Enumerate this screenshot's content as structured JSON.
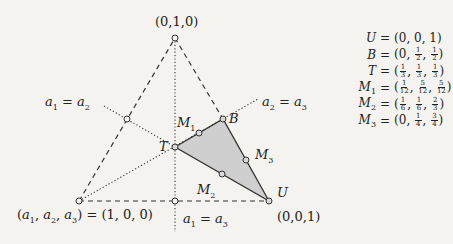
{
  "diagram": {
    "colors": {
      "background": "#f4f3ef",
      "line": "#333333",
      "shade": "#cfcfcf",
      "point_fill": "#d8d8d8"
    },
    "vertices": {
      "top": {
        "label": "(0,1,0)",
        "x": 175,
        "y": 38
      },
      "left": {
        "label": "(a1,a2,a3) = (1,0,0)",
        "x": 79,
        "y": 201
      },
      "right": {
        "label": "(0,0,1)",
        "x": 269,
        "y": 201
      }
    },
    "points": {
      "T": {
        "label": "T",
        "x": 175,
        "y": 147
      },
      "B": {
        "label": "B",
        "x": 223,
        "y": 119
      },
      "U": {
        "label": "U",
        "x": 269,
        "y": 201
      },
      "M1": {
        "label": "M1",
        "x": 199,
        "y": 133
      },
      "M2": {
        "label": "M2",
        "x": 222,
        "y": 174
      },
      "M3": {
        "label": "M3",
        "x": 246,
        "y": 160
      },
      "mid_left": {
        "x": 127,
        "y": 119
      },
      "mid_bottom": {
        "x": 175,
        "y": 201
      }
    },
    "bisector_labels": {
      "a1_eq_a2": "a1 = a2",
      "a2_eq_a3": "a2 = a3",
      "a1_eq_a3": "a1 = a3"
    },
    "legend": [
      {
        "name": "U",
        "sub": "",
        "coords": [
          [
            "0"
          ],
          [
            "0"
          ],
          [
            "1"
          ]
        ]
      },
      {
        "name": "B",
        "sub": "",
        "coords": [
          [
            "0"
          ],
          [
            "1",
            "2"
          ],
          [
            "1",
            "2"
          ]
        ]
      },
      {
        "name": "T",
        "sub": "",
        "coords": [
          [
            "1",
            "3"
          ],
          [
            "1",
            "3"
          ],
          [
            "1",
            "3"
          ]
        ]
      },
      {
        "name": "M",
        "sub": "1",
        "coords": [
          [
            "1",
            "12"
          ],
          [
            "5",
            "12"
          ],
          [
            "5",
            "12"
          ]
        ]
      },
      {
        "name": "M",
        "sub": "2",
        "coords": [
          [
            "1",
            "6"
          ],
          [
            "1",
            "6"
          ],
          [
            "2",
            "3"
          ]
        ]
      },
      {
        "name": "M",
        "sub": "3",
        "coords": [
          [
            "0"
          ],
          [
            "1",
            "4"
          ],
          [
            "3",
            "4"
          ]
        ]
      }
    ]
  }
}
